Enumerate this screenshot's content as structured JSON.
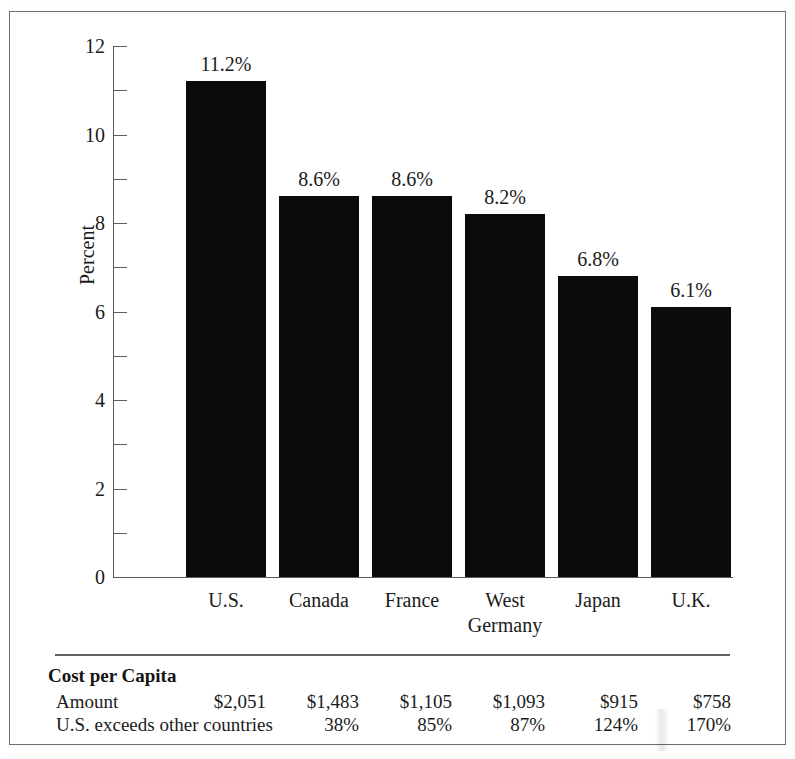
{
  "chart_data": {
    "type": "bar",
    "title": "",
    "xlabel": "",
    "ylabel": "Percent",
    "ylim": [
      0,
      12
    ],
    "ytick_values": [
      0,
      2,
      4,
      6,
      8,
      10,
      12
    ],
    "ytick_labels": [
      "0",
      "2",
      "4",
      "6",
      "8",
      "10",
      "12"
    ],
    "minor_tick_values": [
      1,
      3,
      5,
      7,
      9,
      11
    ],
    "grid": false,
    "legend": false,
    "categories": [
      "U.S.",
      "Canada",
      "France",
      "West Germany",
      "France",
      "U.K."
    ],
    "category_labels": [
      {
        "line1": "U.S.",
        "line2": ""
      },
      {
        "line1": "Canada",
        "line2": ""
      },
      {
        "line1": "France",
        "line2": ""
      },
      {
        "line1": "West",
        "line2": "Germany"
      },
      {
        "line1": "Japan",
        "line2": ""
      },
      {
        "line1": "U.K.",
        "line2": ""
      }
    ],
    "values": [
      11.2,
      8.6,
      8.6,
      8.2,
      6.8,
      6.1
    ],
    "value_labels": [
      "11.2%",
      "8.6%",
      "8.6%",
      "8.2%",
      "6.8%",
      "6.1%"
    ],
    "bar_color": "#0b0b0b"
  },
  "table": {
    "title": "Cost per Capita",
    "rows": [
      {
        "label": "Amount",
        "values": [
          "$2,051",
          "$1,483",
          "$1,105",
          "$1,093",
          "$915",
          "$758"
        ]
      },
      {
        "label": "U.S. exceeds other countries",
        "values": [
          "",
          "38%",
          "85%",
          "87%",
          "124%",
          "170%"
        ]
      }
    ]
  }
}
